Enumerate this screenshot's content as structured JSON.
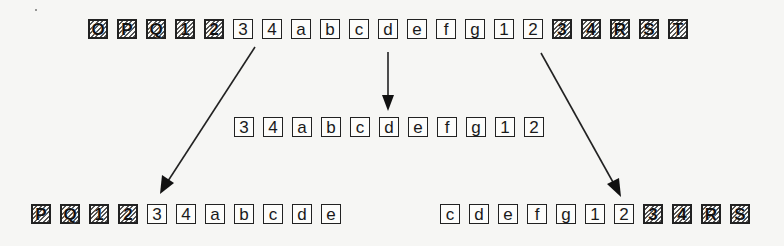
{
  "diagram": {
    "rows": {
      "top": {
        "cells": [
          {
            "label": "O",
            "hatched": true
          },
          {
            "label": "P",
            "hatched": true
          },
          {
            "label": "Q",
            "hatched": true
          },
          {
            "label": "1",
            "hatched": true
          },
          {
            "label": "2",
            "hatched": true
          },
          {
            "label": "3",
            "hatched": false
          },
          {
            "label": "4",
            "hatched": false
          },
          {
            "label": "a",
            "hatched": false
          },
          {
            "label": "b",
            "hatched": false
          },
          {
            "label": "c",
            "hatched": false
          },
          {
            "label": "d",
            "hatched": false
          },
          {
            "label": "e",
            "hatched": false
          },
          {
            "label": "f",
            "hatched": false
          },
          {
            "label": "g",
            "hatched": false
          },
          {
            "label": "1",
            "hatched": false
          },
          {
            "label": "2",
            "hatched": false
          },
          {
            "label": "3",
            "hatched": true
          },
          {
            "label": "4",
            "hatched": true
          },
          {
            "label": "R",
            "hatched": true
          },
          {
            "label": "S",
            "hatched": true
          },
          {
            "label": "T",
            "hatched": true
          }
        ]
      },
      "middle": {
        "cells": [
          {
            "label": "3",
            "hatched": false
          },
          {
            "label": "4",
            "hatched": false
          },
          {
            "label": "a",
            "hatched": false
          },
          {
            "label": "b",
            "hatched": false
          },
          {
            "label": "c",
            "hatched": false
          },
          {
            "label": "d",
            "hatched": false
          },
          {
            "label": "e",
            "hatched": false
          },
          {
            "label": "f",
            "hatched": false
          },
          {
            "label": "g",
            "hatched": false
          },
          {
            "label": "1",
            "hatched": false
          },
          {
            "label": "2",
            "hatched": false
          }
        ]
      },
      "bottom_left": {
        "cells": [
          {
            "label": "P",
            "hatched": true
          },
          {
            "label": "Q",
            "hatched": true
          },
          {
            "label": "1",
            "hatched": true
          },
          {
            "label": "2",
            "hatched": true
          },
          {
            "label": "3",
            "hatched": false
          },
          {
            "label": "4",
            "hatched": false
          },
          {
            "label": "a",
            "hatched": false
          },
          {
            "label": "b",
            "hatched": false
          },
          {
            "label": "c",
            "hatched": false
          },
          {
            "label": "d",
            "hatched": false
          },
          {
            "label": "e",
            "hatched": false
          }
        ]
      },
      "bottom_right": {
        "cells": [
          {
            "label": "c",
            "hatched": false
          },
          {
            "label": "d",
            "hatched": false
          },
          {
            "label": "e",
            "hatched": false
          },
          {
            "label": "f",
            "hatched": false
          },
          {
            "label": "g",
            "hatched": false
          },
          {
            "label": "1",
            "hatched": false
          },
          {
            "label": "2",
            "hatched": false
          },
          {
            "label": "3",
            "hatched": true
          },
          {
            "label": "4",
            "hatched": true
          },
          {
            "label": "R",
            "hatched": true
          },
          {
            "label": "S",
            "hatched": true
          }
        ]
      }
    },
    "arrows": [
      {
        "name": "arrow-to-bottom-left",
        "from": [
          255,
          47
        ],
        "to": [
          160,
          194
        ]
      },
      {
        "name": "arrow-to-middle",
        "from": [
          388,
          52
        ],
        "to": [
          388,
          111
        ]
      },
      {
        "name": "arrow-to-bottom-right",
        "from": [
          541,
          53
        ],
        "to": [
          621,
          197
        ]
      }
    ],
    "colors": {
      "stroke": "#222222",
      "background": "#f6f6f4"
    }
  }
}
